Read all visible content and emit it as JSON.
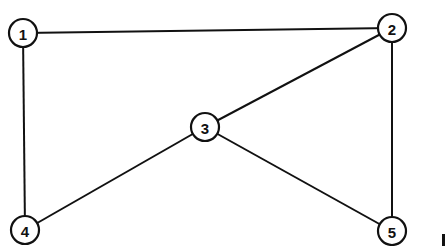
{
  "diagram": {
    "type": "undirected-graph",
    "colors": {
      "stroke": "#111111",
      "node_fill": "#ffffff",
      "background": "#ffffff"
    },
    "node_radius": 14,
    "nodes": [
      {
        "id": "1",
        "label": "1",
        "x": 23,
        "y": 33
      },
      {
        "id": "2",
        "label": "2",
        "x": 392,
        "y": 28
      },
      {
        "id": "3",
        "label": "3",
        "x": 205,
        "y": 127
      },
      {
        "id": "4",
        "label": "4",
        "x": 25,
        "y": 230
      },
      {
        "id": "5",
        "label": "5",
        "x": 392,
        "y": 231
      }
    ],
    "edges": [
      {
        "from": "1",
        "to": "2"
      },
      {
        "from": "1",
        "to": "4"
      },
      {
        "from": "2",
        "to": "3"
      },
      {
        "from": "2",
        "to": "5"
      },
      {
        "from": "3",
        "to": "4"
      },
      {
        "from": "3",
        "to": "5"
      }
    ]
  }
}
